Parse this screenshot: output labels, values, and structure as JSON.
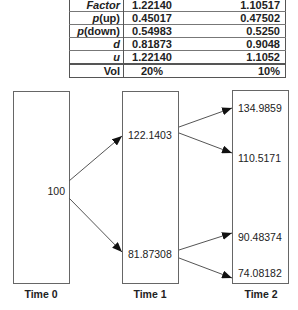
{
  "table": {
    "rows": [
      {
        "label_italic": "Factor",
        "label_rest": "",
        "col1": "1.22140",
        "col2": "1.10517"
      },
      {
        "label_italic": "p",
        "label_rest": "(up)",
        "col1": "0.45017",
        "col2": "0.47502"
      },
      {
        "label_italic": "p",
        "label_rest": "(down)",
        "col1": "0.54983",
        "col2": "0.5250"
      },
      {
        "label_italic": "d",
        "label_rest": "",
        "col1": "0.81873",
        "col2": "0.9048"
      },
      {
        "label_italic": "u",
        "label_rest": "",
        "col1": "1.22140",
        "col2": "1.1052"
      },
      {
        "label_italic": "",
        "label_rest": "Vol",
        "col1": "20%",
        "col2": "10%"
      }
    ]
  },
  "tree": {
    "time_labels": [
      "Time 0",
      "Time 1",
      "Time 2"
    ],
    "nodes": {
      "t0": "100",
      "t1_up": "122.1403",
      "t1_down": "81.87308",
      "t2_uu": "134.9859",
      "t2_ud": "110.5171",
      "t2_du": "90.48374",
      "t2_dd": "74.08182"
    },
    "edges": [
      [
        "t0",
        "t1_up"
      ],
      [
        "t0",
        "t1_down"
      ],
      [
        "t1_up",
        "t2_uu"
      ],
      [
        "t1_up",
        "t2_ud"
      ],
      [
        "t1_down",
        "t2_du"
      ],
      [
        "t1_down",
        "t2_dd"
      ]
    ]
  }
}
